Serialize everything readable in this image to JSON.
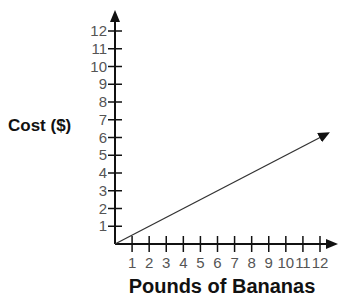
{
  "chart_data": {
    "type": "line",
    "title": "",
    "xlabel": "Pounds of Bananas",
    "ylabel": "Cost ($)",
    "x_ticks": [
      "1",
      "2",
      "3",
      "4",
      "5",
      "6",
      "7",
      "8",
      "9",
      "10",
      "11",
      "12"
    ],
    "y_ticks": [
      "1",
      "2",
      "3",
      "4",
      "5",
      "6",
      "7",
      "8",
      "9",
      "10",
      "11",
      "12"
    ],
    "xlim": [
      0,
      12
    ],
    "ylim": [
      0,
      12
    ],
    "grid": false,
    "series": [
      {
        "name": "Cost",
        "x": [
          0,
          12
        ],
        "y": [
          0,
          6
        ],
        "arrow_end": true
      }
    ]
  }
}
